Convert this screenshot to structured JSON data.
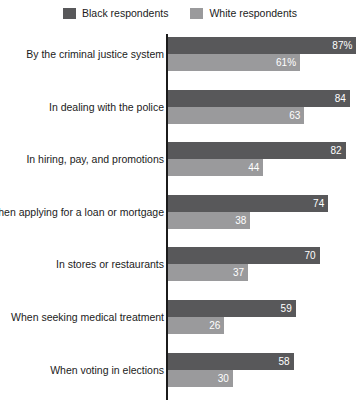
{
  "legend": {
    "entries": [
      {
        "label": "Black respondents",
        "color": "#58585a",
        "swatch_name": "legend-swatch-black"
      },
      {
        "label": "White respondents",
        "color": "#9a9a9c",
        "swatch_name": "legend-swatch-white"
      }
    ]
  },
  "chart_data": {
    "type": "bar",
    "orientation": "horizontal",
    "title": "",
    "subtitle": "",
    "xlabel": "",
    "ylabel": "",
    "xlim": [
      0,
      100
    ],
    "grid": false,
    "legend_position": "top-center",
    "axis_visible": "y-axis-left",
    "categories": [
      "By the criminal justice system",
      "In dealing with the police",
      "In hiring, pay, and promotions",
      "When applying for a loan or mortgage",
      "In stores or restaurants",
      "When seeking medical treatment",
      "When voting in elections"
    ],
    "series": [
      {
        "name": "Black respondents",
        "color": "#58585a",
        "values": [
          87,
          84,
          82,
          74,
          70,
          59,
          58
        ],
        "labels": [
          "87%",
          "84",
          "82",
          "74",
          "70",
          "59",
          "58"
        ]
      },
      {
        "name": "White respondents",
        "color": "#9a9a9c",
        "values": [
          61,
          63,
          44,
          38,
          37,
          26,
          30
        ],
        "labels": [
          "61%",
          "63",
          "44",
          "38",
          "37",
          "26",
          "30"
        ]
      }
    ]
  }
}
